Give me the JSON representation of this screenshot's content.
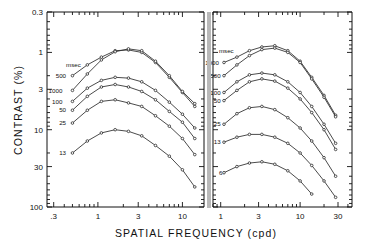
{
  "figure": {
    "xlabel": "SPATIAL   FREQUENCY (cpd)",
    "ylabel": "CONTRAST (%)",
    "units_label": "msec"
  },
  "chart_data": {
    "type": "line",
    "title": "",
    "xlabel": "SPATIAL FREQUENCY (cpd)",
    "ylabel": "CONTRAST (%)",
    "xscale": "log",
    "yscale": "log-inverted",
    "grid": false,
    "legend_position": "inline-left-of-curves",
    "panels": [
      {
        "name": "left-panel",
        "xlim": [
          0.25,
          18
        ],
        "xticks": [
          0.3,
          1,
          3,
          10
        ],
        "xticklabels": [
          ".3",
          "1",
          "3",
          "10"
        ],
        "ylim": [
          0.3,
          100
        ],
        "yticks": [
          0.3,
          1,
          3,
          10,
          30,
          100
        ],
        "yticklabels": [
          "0.3",
          "1",
          "3",
          "10",
          "30",
          "100"
        ],
        "series": [
          {
            "name": "500",
            "label": "500",
            "label_x": 0.42,
            "label_y": 2.0,
            "x": [
              0.5,
              0.75,
              1.1,
              1.6,
              2.3,
              3.3,
              4.8,
              7.0,
              10.0,
              14.0
            ],
            "y": [
              2.0,
              1.45,
              1.15,
              0.95,
              0.93,
              1.0,
              1.35,
              2.1,
              3.3,
              5.0
            ]
          },
          {
            "name": "1000",
            "label": "1000",
            "label_x": 0.38,
            "label_y": 3.1,
            "x": [
              0.5,
              0.75,
              1.1,
              1.6,
              2.3,
              3.3,
              4.8,
              7.0,
              10.0,
              14.0
            ],
            "y": [
              3.1,
              1.9,
              1.25,
              0.98,
              0.9,
              0.95,
              1.3,
              2.0,
              3.2,
              4.6
            ]
          },
          {
            "name": "100",
            "label": "100",
            "label_x": 0.38,
            "label_y": 4.3,
            "x": [
              0.5,
              0.75,
              1.1,
              1.6,
              2.3,
              3.3,
              4.8,
              7.0,
              10.0,
              14.0
            ],
            "y": [
              4.3,
              2.9,
              2.3,
              2.1,
              2.15,
              2.4,
              3.1,
              4.4,
              6.3,
              9.5
            ]
          },
          {
            "name": "50",
            "label": "50",
            "label_x": 0.42,
            "label_y": 5.6,
            "x": [
              0.5,
              0.75,
              1.1,
              1.6,
              2.3,
              3.3,
              4.8,
              7.0,
              10.0,
              14.0
            ],
            "y": [
              5.6,
              3.7,
              2.8,
              2.6,
              2.8,
              3.2,
              4.1,
              5.8,
              8.0,
              13.0
            ]
          },
          {
            "name": "25",
            "label": "25",
            "label_x": 0.42,
            "label_y": 8.2,
            "x": [
              0.5,
              0.75,
              1.1,
              1.6,
              2.3,
              3.3,
              4.8,
              7.0,
              10.0,
              14.0
            ],
            "y": [
              8.2,
              5.6,
              4.3,
              4.1,
              4.5,
              5.0,
              6.6,
              9.0,
              13.0,
              21.0
            ]
          },
          {
            "name": "13",
            "label": "13",
            "label_x": 0.42,
            "label_y": 20.0,
            "x": [
              0.5,
              0.75,
              1.1,
              1.6,
              2.3,
              3.3,
              4.8,
              7.0,
              10.0,
              14.0
            ],
            "y": [
              20.0,
              14.0,
              11.0,
              10.0,
              10.5,
              12.0,
              16.0,
              22.0,
              33.0,
              55.0
            ]
          }
        ]
      },
      {
        "name": "right-panel",
        "xlim": [
          0.8,
          45
        ],
        "xticks": [
          1,
          3,
          10,
          30
        ],
        "xticklabels": [
          "1",
          "3",
          "10",
          "30"
        ],
        "ylim": [
          0.3,
          100
        ],
        "yticks": [
          0.3,
          1,
          3,
          10,
          30,
          100
        ],
        "yticklabels": [
          "0.3",
          "1",
          "3",
          "10",
          "30",
          "100"
        ],
        "series": [
          {
            "name": "1000",
            "label": "1000",
            "label_x": 0.95,
            "label_y": 1.35,
            "x": [
              1.1,
              1.6,
              2.3,
              3.3,
              4.8,
              7.0,
              10.0,
              14.0,
              20.0,
              28.0
            ],
            "y": [
              1.35,
              1.15,
              0.95,
              0.85,
              0.82,
              0.95,
              1.3,
              2.1,
              3.6,
              6.5
            ]
          },
          {
            "name": "500",
            "label": "500",
            "label_x": 1.0,
            "label_y": 2.0,
            "x": [
              1.1,
              1.6,
              2.3,
              3.3,
              4.8,
              7.0,
              10.0,
              14.0,
              20.0,
              28.0
            ],
            "y": [
              2.0,
              1.45,
              1.1,
              0.92,
              0.88,
              1.0,
              1.35,
              2.2,
              3.8,
              6.8
            ]
          },
          {
            "name": "100",
            "label": "100",
            "label_x": 1.0,
            "label_y": 3.3,
            "x": [
              1.1,
              1.6,
              2.3,
              3.3,
              4.8,
              7.0,
              10.0,
              14.0,
              20.0,
              28.0
            ],
            "y": [
              3.3,
              2.4,
              1.95,
              1.85,
              1.95,
              2.4,
              3.3,
              5.0,
              8.5,
              15.0
            ]
          },
          {
            "name": "50",
            "label": "50",
            "label_x": 1.0,
            "label_y": 4.2,
            "x": [
              1.1,
              1.6,
              2.3,
              3.3,
              4.8,
              7.0,
              10.0,
              14.0,
              20.0,
              28.0
            ],
            "y": [
              4.2,
              3.1,
              2.4,
              2.2,
              2.35,
              2.9,
              4.0,
              6.0,
              10.0,
              18.0
            ]
          },
          {
            "name": "25",
            "label": "25",
            "label_x": 1.0,
            "label_y": 8.5,
            "x": [
              1.1,
              1.6,
              2.3,
              3.3,
              4.8,
              7.0,
              10.0,
              14.0,
              20.0,
              28.0
            ],
            "y": [
              8.5,
              6.2,
              5.2,
              5.0,
              5.5,
              7.0,
              9.5,
              14.0,
              23.0,
              40.0
            ]
          },
          {
            "name": "13",
            "label": "13",
            "label_x": 1.0,
            "label_y": 14.5,
            "x": [
              1.1,
              1.6,
              2.3,
              3.3,
              4.8,
              7.0,
              10.0,
              14.0,
              20.0,
              28.0
            ],
            "y": [
              14.5,
              12.5,
              11.5,
              11.5,
              12.5,
              15.0,
              20.0,
              29.0,
              46.0,
              75.0
            ]
          },
          {
            "name": "6",
            "label": "6",
            "label_x": 1.05,
            "label_y": 36.0,
            "x": [
              1.1,
              1.6,
              2.3,
              3.3,
              4.8,
              7.0,
              10.0,
              14.0
            ],
            "y": [
              36.0,
              30.0,
              27.0,
              26.0,
              28.0,
              34.0,
              46.0,
              68.0
            ]
          }
        ]
      }
    ]
  },
  "colors": {
    "axis": "#111111",
    "curve": "#2b2b2b",
    "divider": "#b9b9b9",
    "background": "#ffffff"
  }
}
